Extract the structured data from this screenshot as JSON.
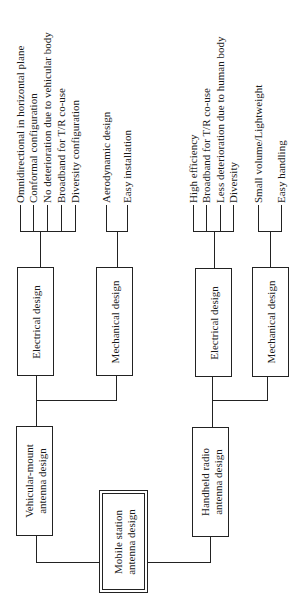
{
  "root": {
    "line1": "Mobile station",
    "line2": "antenna design"
  },
  "branches": [
    {
      "line1": "Vehicular-mount",
      "line2": "antenna design",
      "electrical": {
        "label": "Electrical design",
        "items": [
          "Omnidirectional in horizontal plane",
          "Conformal configuration",
          "No deterioration due to vehicular body",
          "Broadband for T/R co-use",
          "Diversity configuration"
        ]
      },
      "mechanical": {
        "label": "Mechanical design",
        "items": [
          "Aerodynamic design",
          "Easy installation"
        ]
      }
    },
    {
      "line1": "Handheld radio",
      "line2": "antenna design",
      "electrical": {
        "label": "Electrical design",
        "items": [
          "High efficiency",
          "Broadband for T/R co-use",
          "Less deterioration due to human body",
          "Diversity"
        ]
      },
      "mechanical": {
        "label": "Mechanical design",
        "items": [
          "Small volume/Lightweight",
          "Easy handling"
        ]
      }
    }
  ]
}
